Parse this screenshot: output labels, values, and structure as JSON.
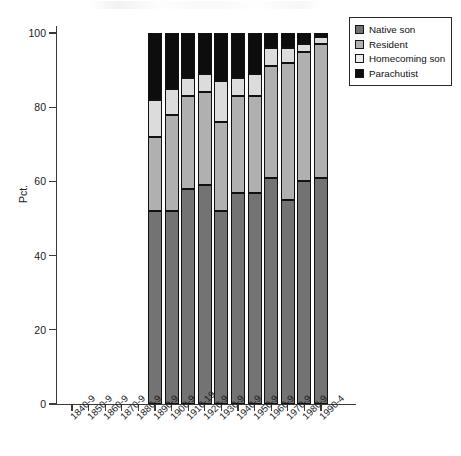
{
  "chart_data": {
    "type": "bar",
    "subtype": "stacked-bar-100pct",
    "title": "",
    "xlabel": "",
    "ylabel": "Pct.",
    "ylim": [
      0,
      100
    ],
    "yticks": [
      0,
      20,
      40,
      60,
      80,
      100
    ],
    "grid": false,
    "legend_position": "top-right",
    "categories": [
      "1840-9",
      "1850-9",
      "1860-9",
      "1870-9",
      "1880-9",
      "1890-9",
      "1900-9",
      "1910-19",
      "1920-9",
      "1930-9",
      "1940-9",
      "1950-9",
      "1960-9",
      "1970-9",
      "1980-9",
      "1990-4"
    ],
    "series": [
      {
        "name": "Native son",
        "color": "#737373",
        "values": [
          0,
          0,
          0,
          0,
          0,
          52,
          52,
          58,
          59,
          52,
          57,
          57,
          61,
          55,
          60,
          61
        ]
      },
      {
        "name": "Resident",
        "color": "#b0b0b0",
        "values": [
          0,
          0,
          0,
          0,
          0,
          20,
          26,
          25,
          25,
          24,
          26,
          26,
          30,
          37,
          35,
          36
        ]
      },
      {
        "name": "Homecoming son",
        "color": "#dcdcdc",
        "values": [
          0,
          0,
          0,
          0,
          0,
          10,
          7,
          5,
          5,
          11,
          5,
          6,
          5,
          4,
          2,
          2
        ]
      },
      {
        "name": "Parachutist",
        "color": "#0d0d0d",
        "values": [
          0,
          0,
          0,
          0,
          0,
          18,
          15,
          12,
          11,
          13,
          12,
          11,
          4,
          4,
          3,
          1
        ]
      }
    ]
  },
  "legend": {
    "items": [
      {
        "label": "Native son",
        "swatch": "native"
      },
      {
        "label": "Resident",
        "swatch": "resident"
      },
      {
        "label": "Homecoming son",
        "swatch": "homecoming"
      },
      {
        "label": "Parachutist",
        "swatch": "parachutist"
      }
    ]
  },
  "axes": {
    "y_title": "Pct.",
    "y_tick_labels": [
      "0",
      "20",
      "40",
      "60",
      "80",
      "100"
    ]
  }
}
